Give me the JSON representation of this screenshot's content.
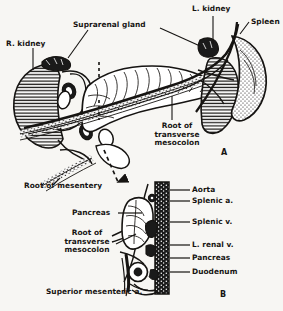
{
  "figure": {
    "panels": [
      {
        "letter": "A",
        "name": "anterior-view"
      },
      {
        "letter": "B",
        "name": "sagittal-view"
      }
    ]
  },
  "panel_a": {
    "labels": {
      "r_kidney": "R. kidney",
      "suprarenal_gland": "Suprarenal gland",
      "l_kidney": "L. kidney",
      "spleen": "Spleen",
      "root_transverse_mesocolon": "Root of\ntransverse\nmesocolon",
      "root_of_mesentery": "Root of mesentery"
    },
    "marker": "A"
  },
  "panel_b": {
    "labels": {
      "aorta": "Aorta",
      "splenic_a": "Splenic a.",
      "splenic_v": "Splenic v.",
      "l_renal_v": "L. renal v.",
      "pancreas_right": "Pancreas",
      "duodenum": "Duodenum",
      "pancreas_left": "Pancreas",
      "root_transverse_mesocolon": "Root of\ntransverse\nmesocolon",
      "superior_mesenteric_a": "Superior mesenteric a."
    },
    "marker": "B"
  },
  "colors": {
    "ink": "#161412",
    "paper": "#f7f6f3",
    "organ_fill": "#ffffff",
    "vessel_dark": "#1a1a1a"
  }
}
